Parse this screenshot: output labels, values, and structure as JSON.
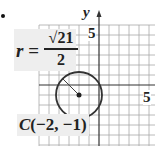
{
  "figure": {
    "marker": "bullet",
    "radius_label": {
      "variable": "r",
      "equals": "=",
      "numerator": "√21",
      "denominator": "2"
    },
    "center_label": {
      "name": "C",
      "coords": "(−2, −1)"
    },
    "axes": {
      "y_label": "y",
      "y_tick": "5",
      "x_tick": "5"
    },
    "circle": {
      "center": [
        -2,
        -1
      ],
      "radius": 2.2913
    },
    "colors": {
      "ink": "#222222",
      "grid": "#9a9a9a",
      "label_bg": "#eeeeee"
    }
  }
}
